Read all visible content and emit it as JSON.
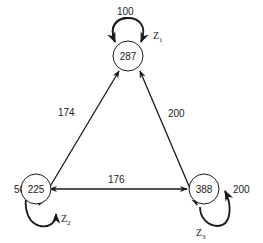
{
  "diagram": {
    "nodes": [
      {
        "id": "top",
        "value": "287",
        "loop_weight": "100",
        "loop_label": "Z",
        "loop_sub": "1"
      },
      {
        "id": "left",
        "value": "225",
        "loop_weight": "50",
        "loop_label": "Z",
        "loop_sub": "2"
      },
      {
        "id": "right",
        "value": "388",
        "loop_weight": "200",
        "loop_label": "Z",
        "loop_sub": "3"
      }
    ],
    "edges": [
      {
        "from": "top",
        "to": "left",
        "weight": "174"
      },
      {
        "from": "top",
        "to": "right",
        "weight": "200"
      },
      {
        "from": "left",
        "to": "right",
        "weight": "176"
      }
    ],
    "colors": {
      "stroke": "#1a1a1a",
      "background": "#ffffff"
    }
  }
}
